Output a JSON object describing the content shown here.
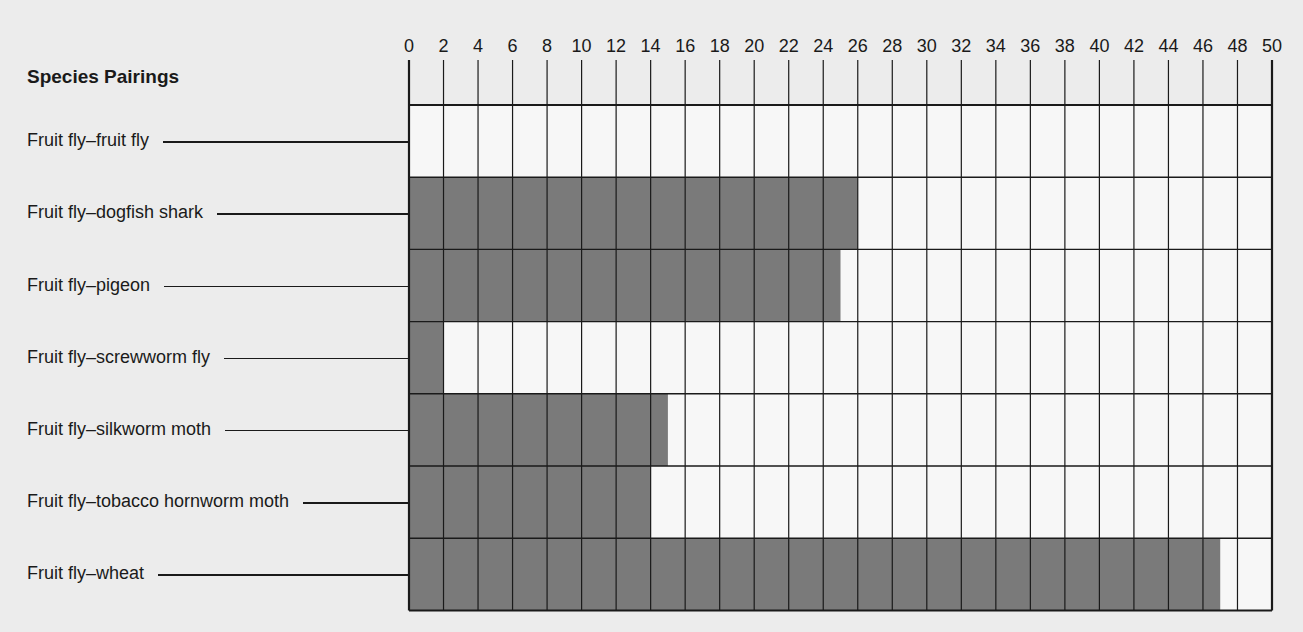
{
  "chart_data": {
    "type": "bar",
    "orientation": "horizontal",
    "title": "",
    "ylabel": "Species Pairings",
    "xlabel": "",
    "categories": [
      "Fruit fly–fruit fly",
      "Fruit fly–dogfish shark",
      "Fruit fly–pigeon",
      "Fruit fly–screwworm fly",
      "Fruit fly–silkworm moth",
      "Fruit fly–tobacco hornworm moth",
      "Fruit fly–wheat"
    ],
    "values": [
      0,
      26,
      25,
      2,
      15,
      14,
      47
    ],
    "xlim": [
      0,
      50
    ],
    "x_ticks": [
      0,
      2,
      4,
      6,
      8,
      10,
      12,
      14,
      16,
      18,
      20,
      22,
      24,
      26,
      28,
      30,
      32,
      34,
      36,
      38,
      40,
      42,
      44,
      46,
      48,
      50
    ],
    "grid": true,
    "legend": null,
    "bar_color": "#7a7a7a"
  },
  "header": {
    "title": "Species Pairings"
  }
}
